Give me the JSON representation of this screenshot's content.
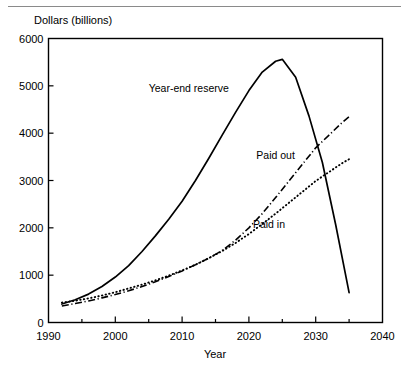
{
  "figure": {
    "has_top_rule": true,
    "background": "#ffffff",
    "ink_color": "#000000"
  },
  "chart_data": {
    "type": "line",
    "title": "",
    "subtitle": "",
    "xlabel": "Year",
    "ylabel": "Dollars (billions)",
    "xlim": [
      1990,
      2040
    ],
    "ylim": [
      0,
      6000
    ],
    "xticks": [
      1990,
      2000,
      2010,
      2020,
      2030,
      2040
    ],
    "xtick_labels": [
      "1990",
      "2000",
      "2010",
      "2020",
      "2030",
      "2040"
    ],
    "xminor_ticks": [
      1995,
      2005,
      2015,
      2025,
      2035
    ],
    "yticks": [
      0,
      1000,
      2000,
      3000,
      4000,
      5000,
      6000
    ],
    "ytick_labels": [
      "0",
      "1000",
      "2000",
      "3000",
      "4000",
      "5000",
      "6000"
    ],
    "grid": false,
    "legend_position": "inline-annotations",
    "series": [
      {
        "name": "Year-end reserve",
        "style": "solid",
        "label_x": 2011,
        "label_y": 4880,
        "x": [
          1992,
          1994,
          1996,
          1998,
          2000,
          2002,
          2004,
          2006,
          2008,
          2010,
          2012,
          2014,
          2016,
          2018,
          2020,
          2022,
          2024,
          2025,
          2027,
          2029,
          2031,
          2033,
          2035
        ],
        "y": [
          390,
          480,
          600,
          760,
          960,
          1200,
          1500,
          1830,
          2180,
          2560,
          3000,
          3470,
          3960,
          4440,
          4900,
          5290,
          5520,
          5560,
          5180,
          4360,
          3380,
          2060,
          630
        ]
      },
      {
        "name": "Paid out",
        "style": "dash-dot",
        "label_x": 2024,
        "label_y": 3460,
        "x": [
          1992,
          1994,
          1996,
          1998,
          2000,
          2002,
          2004,
          2006,
          2008,
          2010,
          2012,
          2014,
          2016,
          2018,
          2020,
          2022,
          2024,
          2026,
          2028,
          2030,
          2032,
          2034,
          2035
        ],
        "y": [
          350,
          400,
          455,
          520,
          590,
          670,
          760,
          860,
          970,
          1090,
          1220,
          1360,
          1520,
          1740,
          2000,
          2300,
          2640,
          2990,
          3340,
          3690,
          3960,
          4230,
          4350
        ]
      },
      {
        "name": "Paid in",
        "style": "dotted",
        "label_x": 2023,
        "label_y": 1990,
        "x": [
          1992,
          1994,
          1996,
          1998,
          2000,
          2002,
          2004,
          2006,
          2008,
          2010,
          2012,
          2014,
          2016,
          2018,
          2020,
          2022,
          2024,
          2026,
          2028,
          2030,
          2032,
          2034,
          2035
        ],
        "y": [
          420,
          460,
          510,
          570,
          640,
          720,
          800,
          890,
          990,
          1100,
          1220,
          1360,
          1510,
          1680,
          1870,
          2080,
          2300,
          2530,
          2760,
          2990,
          3180,
          3370,
          3450
        ]
      }
    ]
  }
}
